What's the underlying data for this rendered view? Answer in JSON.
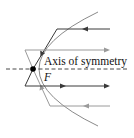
{
  "diagram": {
    "type": "parabolic-reflector",
    "labels": {
      "axis": "Axis of symmetry",
      "focus": "F"
    },
    "colors": {
      "parabola": "#8a8a8a",
      "dark_ray": "#3a3a3a",
      "light_ray": "#9a9a9a",
      "axis": "#333333",
      "focus_point": "#000000",
      "background": "#ffffff"
    },
    "geometry": {
      "vertex": [
        16,
        69
      ],
      "focus": [
        33,
        69
      ],
      "parabola_top_end": [
        98,
        12
      ],
      "parabola_bottom_end": [
        98,
        126
      ]
    },
    "rays": [
      {
        "name": "incoming-top-ray",
        "shade": "dark",
        "direction": "incoming",
        "y": 29
      },
      {
        "name": "outgoing-upper-ray",
        "shade": "light",
        "direction": "outgoing",
        "y": 50
      },
      {
        "name": "outgoing-lower-ray",
        "shade": "dark",
        "direction": "outgoing",
        "y": 86
      },
      {
        "name": "incoming-bottom-ray",
        "shade": "light",
        "direction": "incoming",
        "y": 106
      }
    ]
  }
}
